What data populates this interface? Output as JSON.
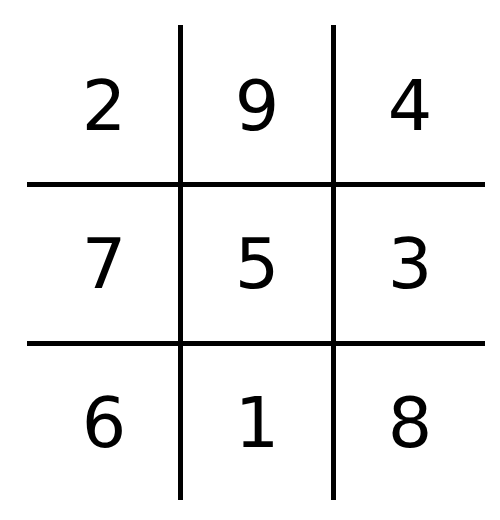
{
  "diagram": {
    "colors": {
      "line": "#000000",
      "text": "#000000",
      "background": "#ffffff"
    },
    "rows": [
      [
        "2",
        "9",
        "4"
      ],
      [
        "7",
        "5",
        "3"
      ],
      [
        "6",
        "1",
        "8"
      ]
    ]
  }
}
